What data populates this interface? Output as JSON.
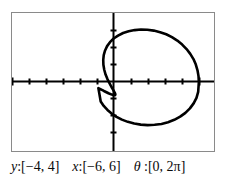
{
  "window": {
    "frame_border_color": "#8a8a8a",
    "background_color": "#ffffff",
    "axis_color": "#000000",
    "curve_color": "#000000"
  },
  "caption": {
    "y_var": "y",
    "y_range": ":[−4, 4]",
    "x_var": "x",
    "x_range": ":[−6, 6]",
    "theta_var": "θ",
    "theta_range": " :[0, 2π]"
  },
  "chart_data": {
    "type": "line",
    "title": "",
    "xlabel": "",
    "ylabel": "",
    "xlim": [
      -6,
      6
    ],
    "ylim": [
      -4,
      4
    ],
    "grid": false,
    "legend": null,
    "axes": {
      "x_axis_y_value": 0,
      "y_axis_x_value": 0,
      "x_tick_step": 1,
      "y_tick_step": 1,
      "x_ticks": [
        -6,
        -5,
        -4,
        -3,
        -2,
        -1,
        1,
        2,
        3,
        4,
        5,
        6
      ],
      "y_ticks": [
        -4,
        -3,
        -2,
        -1,
        1,
        2,
        3,
        4
      ]
    },
    "parameter": {
      "name": "θ",
      "range": [
        0,
        6.283185307179586
      ]
    },
    "series": [
      {
        "name": "polar-curve",
        "closed": true,
        "x": [
          5.1,
          5.08,
          5.02,
          4.92,
          4.78,
          4.59,
          4.37,
          4.11,
          3.82,
          3.5,
          3.16,
          2.8,
          2.42,
          2.04,
          1.66,
          1.29,
          0.93,
          0.6,
          0.3,
          0.04,
          -0.18,
          -0.35,
          -0.47,
          -0.55,
          -0.58,
          -0.57,
          -0.52,
          -0.44,
          -0.33,
          -0.21,
          -0.09,
          0.02,
          0.1,
          0.14,
          0.13,
          0.06,
          -0.07,
          -0.27,
          -0.54,
          -0.87,
          -0.73,
          -0.55,
          -0.33,
          -0.08,
          0.21,
          0.53,
          0.88,
          1.26,
          1.65,
          2.06,
          2.47,
          2.88,
          3.27,
          3.64,
          3.99,
          4.3,
          4.57,
          4.79,
          4.96,
          5.06,
          5.1
        ],
        "y": [
          0.0,
          0.34,
          0.68,
          1.01,
          1.33,
          1.63,
          1.91,
          2.17,
          2.4,
          2.6,
          2.77,
          2.89,
          2.98,
          3.03,
          3.04,
          3.01,
          2.94,
          2.84,
          2.69,
          2.52,
          2.31,
          2.08,
          1.83,
          1.56,
          1.28,
          1.0,
          0.71,
          0.43,
          0.17,
          -0.07,
          -0.29,
          -0.47,
          -0.61,
          -0.71,
          -0.76,
          -0.77,
          -0.73,
          -0.65,
          -0.52,
          -0.35,
          -1.13,
          -1.39,
          -1.62,
          -1.83,
          -2.02,
          -2.18,
          -2.31,
          -2.41,
          -2.47,
          -2.5,
          -2.48,
          -2.43,
          -2.33,
          -2.19,
          -2.01,
          -1.79,
          -1.53,
          -1.24,
          -0.92,
          -0.57,
          0.0
        ]
      }
    ]
  }
}
